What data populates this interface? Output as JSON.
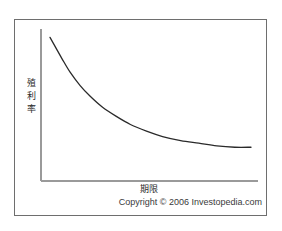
{
  "figure": {
    "background_color": "#ffffff",
    "frame_color": "#6e6e6e",
    "axis_color": "#9a9a9a",
    "curve_color": "#2a2a2a"
  },
  "labels": {
    "y_axis": "殖利率",
    "x_axis": "期限",
    "copyright": "Copyright © 2006 Investopedia.com"
  },
  "chart_data": {
    "type": "line",
    "title": "",
    "subtitle": "",
    "xlabel": "期限",
    "ylabel": "殖利率",
    "grid": false,
    "legend": "none",
    "annotations": [
      "Copyright © 2006 Investopedia.com"
    ],
    "axis_ticks": {
      "x": [],
      "y": []
    },
    "xlim": [
      0,
      100
    ],
    "ylim": [
      0,
      100
    ],
    "series": [
      {
        "name": "殖利率曲線",
        "description": "Inverted (downward sloping) yield curve: yield falls steeply with maturity then flattens",
        "x": [
          0,
          3,
          6,
          10,
          15,
          20,
          26,
          33,
          40,
          48,
          56,
          65,
          74,
          83,
          92,
          100
        ],
        "y": [
          96,
          88,
          80,
          70,
          60,
          52,
          44,
          37,
          31,
          26,
          22,
          19,
          17,
          15,
          14,
          14
        ]
      }
    ]
  }
}
